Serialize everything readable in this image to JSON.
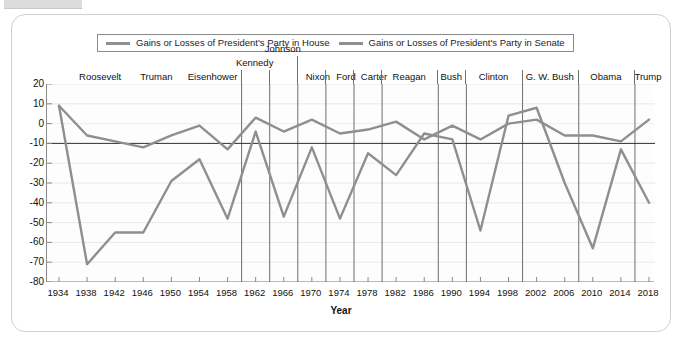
{
  "card": {
    "title": ""
  },
  "legend": {
    "position": "top-center",
    "entries": [
      {
        "label": "Gains or Losses of President's Party in House",
        "color": "#8f8f8f",
        "icon": "line-swatch"
      },
      {
        "label": "Gains or Losses of President's Party in Senate",
        "color": "#8f8f8f",
        "icon": "line-swatch"
      }
    ]
  },
  "presidents": [
    {
      "name": "Roosevelt",
      "center_year": 1940
    },
    {
      "name": "Truman",
      "center_year": 1948
    },
    {
      "name": "Eisenhower",
      "center_year": 1956
    },
    {
      "name": "Kennedy",
      "center_year": 1962
    },
    {
      "name": "Johnson",
      "center_year": 1966
    },
    {
      "name": "Nixon",
      "center_year": 1971
    },
    {
      "name": "Ford",
      "center_year": 1975
    },
    {
      "name": "Carter",
      "center_year": 1979
    },
    {
      "name": "Reagan",
      "center_year": 1984
    },
    {
      "name": "Bush",
      "center_year": 1990
    },
    {
      "name": "Clinton",
      "center_year": 1996
    },
    {
      "name": "G. W. Bush",
      "center_year": 2004
    },
    {
      "name": "Obama",
      "center_year": 2012
    },
    {
      "name": "Trump",
      "center_year": 2018
    }
  ],
  "president_dividers": [
    1960,
    1964,
    1968,
    1972,
    1976,
    1980,
    1988,
    1992,
    2000,
    2008,
    2016
  ],
  "chart_data": {
    "type": "line",
    "title": "",
    "xlabel": "Year",
    "ylabel": "",
    "grid": true,
    "xlim": [
      1934,
      2018
    ],
    "ylim": [
      -80,
      20
    ],
    "ytick_step": 10,
    "xtick_step": 4,
    "x": [
      1934,
      1938,
      1942,
      1946,
      1950,
      1954,
      1958,
      1962,
      1966,
      1970,
      1974,
      1978,
      1982,
      1986,
      1990,
      1994,
      1998,
      2002,
      2006,
      2010,
      2014,
      2018
    ],
    "xticklabels": [
      "1934",
      "1938",
      "1942",
      "1946",
      "1950",
      "1954",
      "1958",
      "1962",
      "1966",
      "1970",
      "1974",
      "1978",
      "1982",
      "1986",
      "1990",
      "1994",
      "1998",
      "2002",
      "2006",
      "2010",
      "2014",
      "2018"
    ],
    "yticklabels": [
      "20",
      "10",
      "0",
      "-10",
      "-20",
      "-30",
      "-40",
      "-50",
      "-60",
      "-70",
      "-80"
    ],
    "series": [
      {
        "name": "Gains or Losses of President's Party in House",
        "color": "#8f8f8f",
        "values": [
          9,
          -71,
          -55,
          -55,
          -29,
          -18,
          -48,
          -4,
          -47,
          -12,
          -48,
          -15,
          -26,
          -5,
          -8,
          -54,
          4,
          8,
          -30,
          -63,
          -13,
          -40
        ]
      },
      {
        "name": "Gains or Losses of President's Party in Senate",
        "color": "#8f8f8f",
        "values": [
          9,
          -6,
          -9,
          -12,
          -6,
          -1,
          -13,
          3,
          -4,
          2,
          -5,
          -3,
          1,
          -8,
          -1,
          -8,
          0,
          2,
          -6,
          -6,
          -9,
          2
        ]
      }
    ]
  }
}
